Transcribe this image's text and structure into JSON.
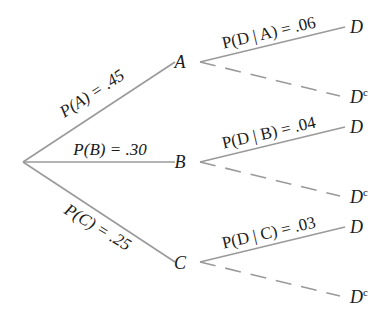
{
  "diagram": {
    "type": "probability tree",
    "root": {
      "x": 23,
      "y": 162
    },
    "colors": {
      "line": "#9a9a9a",
      "text": "#1a1a1a"
    },
    "first_level": [
      {
        "node": "A",
        "label": "P(A) = .45",
        "node_x": 180,
        "node_y": 62,
        "edge_end_x": 175,
        "edge_end_y": 62,
        "label_x": 95,
        "label_y": 98,
        "label_angle": -33
      },
      {
        "node": "B",
        "label": "P(B) = .30",
        "node_x": 180,
        "node_y": 162,
        "edge_end_x": 175,
        "edge_end_y": 162,
        "label_x": 110,
        "label_y": 155,
        "label_angle": 0
      },
      {
        "node": "C",
        "label": "P(C) = .25",
        "node_x": 180,
        "node_y": 263,
        "edge_end_x": 175,
        "edge_end_y": 262,
        "label_x": 95,
        "label_y": 232,
        "label_angle": 31
      }
    ],
    "second_level": [
      {
        "parent": "A",
        "label": "P(D | A) = .06",
        "start_x": 200,
        "start_y": 62,
        "d_end_x": 345,
        "d_end_y": 27,
        "dc_end_x": 340,
        "dc_end_y": 96,
        "label_x": 270,
        "label_y": 38,
        "label_angle": -13,
        "d_x": 350,
        "d_y": 33,
        "dc_x": 350,
        "dc_y": 103
      },
      {
        "parent": "B",
        "label": "P(D | B) = .04",
        "start_x": 200,
        "start_y": 162,
        "d_end_x": 345,
        "d_end_y": 127,
        "dc_end_x": 340,
        "dc_end_y": 196,
        "label_x": 270,
        "label_y": 138,
        "label_angle": -13,
        "d_x": 350,
        "d_y": 133,
        "dc_x": 350,
        "dc_y": 203
      },
      {
        "parent": "C",
        "label": "P(D | C) = .03",
        "start_x": 200,
        "start_y": 262,
        "d_end_x": 345,
        "d_end_y": 227,
        "dc_end_x": 340,
        "dc_end_y": 296,
        "label_x": 270,
        "label_y": 238,
        "label_angle": -13,
        "d_x": 350,
        "d_y": 233,
        "dc_x": 350,
        "dc_y": 303
      }
    ],
    "outcome_labels": {
      "d": "D",
      "dc_base": "D",
      "dc_sup": "c"
    }
  }
}
